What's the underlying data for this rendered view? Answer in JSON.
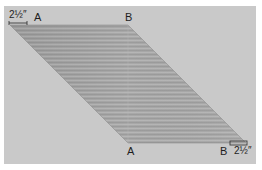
{
  "diagram": {
    "title": "",
    "background_color": "#c9c9c9",
    "fabric_color": "#a9a9a9",
    "shape": "parallelogram",
    "top_labels": {
      "measurement": "2½″",
      "point_a": "A",
      "point_b": "B"
    },
    "bottom_labels": {
      "point_a": "A",
      "point_b": "B",
      "measurement": "2½″"
    }
  }
}
